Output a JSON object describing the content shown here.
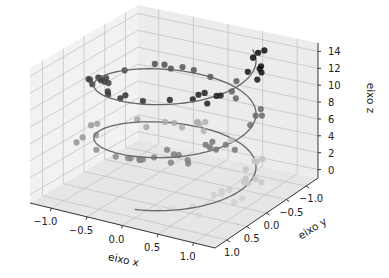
{
  "chart_data": {
    "type": "scatter3d",
    "title": "",
    "xlabel": "eixo x",
    "ylabel": "eixo y",
    "zlabel": "eixo z",
    "xticks": [
      "−1.0",
      "−0.5",
      "0.0",
      "0.5",
      "1.0"
    ],
    "yticks": [
      "−1.0",
      "−0.5",
      "0.0",
      "0.5",
      "1.0"
    ],
    "zticks": [
      "0",
      "2",
      "4",
      "6",
      "8",
      "10",
      "12",
      "14"
    ],
    "xlim": [
      -1.3,
      1.3
    ],
    "ylim": [
      -1.3,
      1.3
    ],
    "zlim": [
      -1,
      15
    ],
    "grid": true,
    "line": {
      "name": "helix",
      "color": "#555555",
      "description": "3D spiral: x = sin(z), y = cos(z), z from 0 to 15",
      "z_range": [
        0,
        15
      ]
    },
    "scatter": {
      "name": "noisy points along helix",
      "colormap": "Greys",
      "count": 100,
      "description": "points near helix with random noise, shaded darker with higher z"
    }
  }
}
